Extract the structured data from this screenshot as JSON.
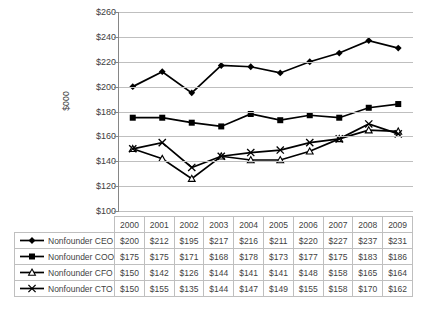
{
  "chart_data": {
    "type": "line",
    "title": "",
    "xlabel": "",
    "ylabel": "$000",
    "ylim": [
      100,
      260
    ],
    "ytick_step": 20,
    "ytick_labels": [
      "$260",
      "$240",
      "$220",
      "$200",
      "$180",
      "$160",
      "$140",
      "$120",
      "$100"
    ],
    "ytick_values": [
      260,
      240,
      220,
      200,
      180,
      160,
      140,
      120,
      100
    ],
    "grid": true,
    "legend_position": "bottom-table",
    "categories": [
      "2000",
      "2001",
      "2002",
      "2003",
      "2004",
      "2005",
      "2006",
      "2007",
      "2008",
      "2009"
    ],
    "series": [
      {
        "name": "Nonfounder CEO Salary",
        "marker": "diamond",
        "values": [
          200,
          212,
          195,
          217,
          216,
          211,
          220,
          227,
          237,
          231
        ],
        "labels": [
          "$200",
          "$212",
          "$195",
          "$217",
          "$216",
          "$211",
          "$220",
          "$227",
          "$237",
          "$231"
        ]
      },
      {
        "name": "Nonfounder COO Salary",
        "marker": "square",
        "values": [
          175,
          175,
          171,
          168,
          178,
          173,
          177,
          175,
          183,
          186
        ],
        "labels": [
          "$175",
          "$175",
          "$171",
          "$168",
          "$178",
          "$173",
          "$177",
          "$175",
          "$183",
          "$186"
        ]
      },
      {
        "name": "Nonfounder CFO Salary",
        "marker": "triangle",
        "values": [
          150,
          142,
          126,
          144,
          141,
          141,
          148,
          158,
          165,
          164
        ],
        "labels": [
          "$150",
          "$142",
          "$126",
          "$144",
          "$141",
          "$141",
          "$148",
          "$158",
          "$165",
          "$164"
        ]
      },
      {
        "name": "Nonfounder CTO Salary",
        "marker": "cross",
        "values": [
          150,
          155,
          135,
          144,
          147,
          149,
          155,
          158,
          170,
          162
        ],
        "labels": [
          "$150",
          "$155",
          "$135",
          "$144",
          "$147",
          "$149",
          "$155",
          "$158",
          "$170",
          "$162"
        ]
      }
    ],
    "colors": {
      "series_line": "#000000",
      "gridline": "#bfbfbf",
      "axis": "#868686",
      "text": "#3f3f3f",
      "table_border": "#bfbfbf"
    }
  }
}
